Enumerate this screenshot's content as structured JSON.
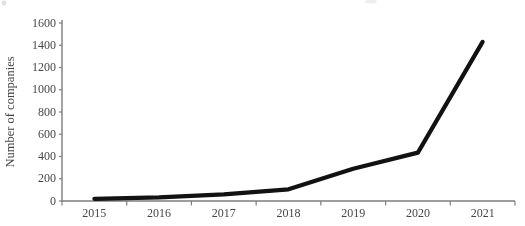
{
  "figure": {
    "background": "#ffffff",
    "axis_color": "#7d7d7d",
    "label_color": "#474747",
    "line_color": "#121212"
  },
  "chart_data": {
    "type": "line",
    "title": "",
    "xlabel": "",
    "ylabel": "Number of companies",
    "categories": [
      "2015",
      "2016",
      "2017",
      "2018",
      "2019",
      "2020",
      "2021"
    ],
    "series": [
      {
        "name": "Number of companies",
        "values": [
          20,
          32,
          60,
          105,
          290,
          435,
          1430
        ]
      }
    ],
    "ylim": [
      0,
      1600
    ],
    "yticks": [
      0,
      200,
      400,
      600,
      800,
      1000,
      1200,
      1400,
      1600
    ],
    "ytick_labels": [
      "0",
      "200",
      "400",
      "600",
      "800",
      "1000",
      "1200",
      "1400",
      "1600"
    ],
    "grid": false,
    "legend_position": "none"
  }
}
